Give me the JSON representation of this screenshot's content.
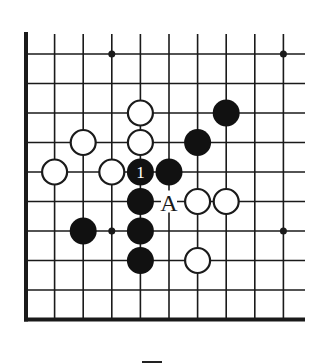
{
  "diagram": {
    "type": "go-board-fragment",
    "columns": 10,
    "rows": 10,
    "edges": [
      "left",
      "bottom"
    ],
    "colors": {
      "line": "#1a1a1a",
      "black_stone": "#111111",
      "white_stone": "#ffffff",
      "background": "#ffffff"
    },
    "star_points": [
      {
        "col": 3,
        "row": 0
      },
      {
        "col": 9,
        "row": 0
      },
      {
        "col": 3,
        "row": 6
      },
      {
        "col": 9,
        "row": 6
      }
    ],
    "stones": [
      {
        "color": "white",
        "col": 4,
        "row": 2
      },
      {
        "color": "black",
        "col": 7,
        "row": 2
      },
      {
        "color": "white",
        "col": 2,
        "row": 3
      },
      {
        "color": "white",
        "col": 4,
        "row": 3
      },
      {
        "color": "black",
        "col": 6,
        "row": 3
      },
      {
        "color": "white",
        "col": 1,
        "row": 4
      },
      {
        "color": "white",
        "col": 3,
        "row": 4
      },
      {
        "color": "black",
        "col": 4,
        "row": 4,
        "label": "1"
      },
      {
        "color": "black",
        "col": 5,
        "row": 4
      },
      {
        "color": "black",
        "col": 4,
        "row": 5
      },
      {
        "color": "white",
        "col": 6,
        "row": 5
      },
      {
        "color": "white",
        "col": 7,
        "row": 5
      },
      {
        "color": "black",
        "col": 2,
        "row": 6
      },
      {
        "color": "black",
        "col": 4,
        "row": 6
      },
      {
        "color": "black",
        "col": 4,
        "row": 7
      },
      {
        "color": "white",
        "col": 6,
        "row": 7
      }
    ],
    "markers": [
      {
        "label": "A",
        "col": 5,
        "row": 5
      }
    ]
  }
}
